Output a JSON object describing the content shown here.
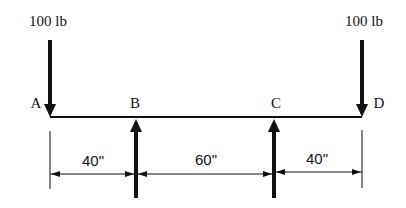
{
  "diagram": {
    "colors": {
      "ink": "#111111",
      "background": "#ffffff"
    },
    "loads": [
      {
        "label": "100 lb",
        "point": "A",
        "direction": "down"
      },
      {
        "label": "100 lb",
        "point": "D",
        "direction": "down"
      }
    ],
    "points": {
      "A": "A",
      "B": "B",
      "C": "C",
      "D": "D"
    },
    "reactions": [
      {
        "point": "B",
        "direction": "up"
      },
      {
        "point": "C",
        "direction": "up"
      }
    ],
    "dimensions": [
      {
        "from": "A",
        "to": "B",
        "label": "40\""
      },
      {
        "from": "B",
        "to": "C",
        "label": "60\""
      },
      {
        "from": "C",
        "to": "D",
        "label": "40\""
      }
    ]
  }
}
